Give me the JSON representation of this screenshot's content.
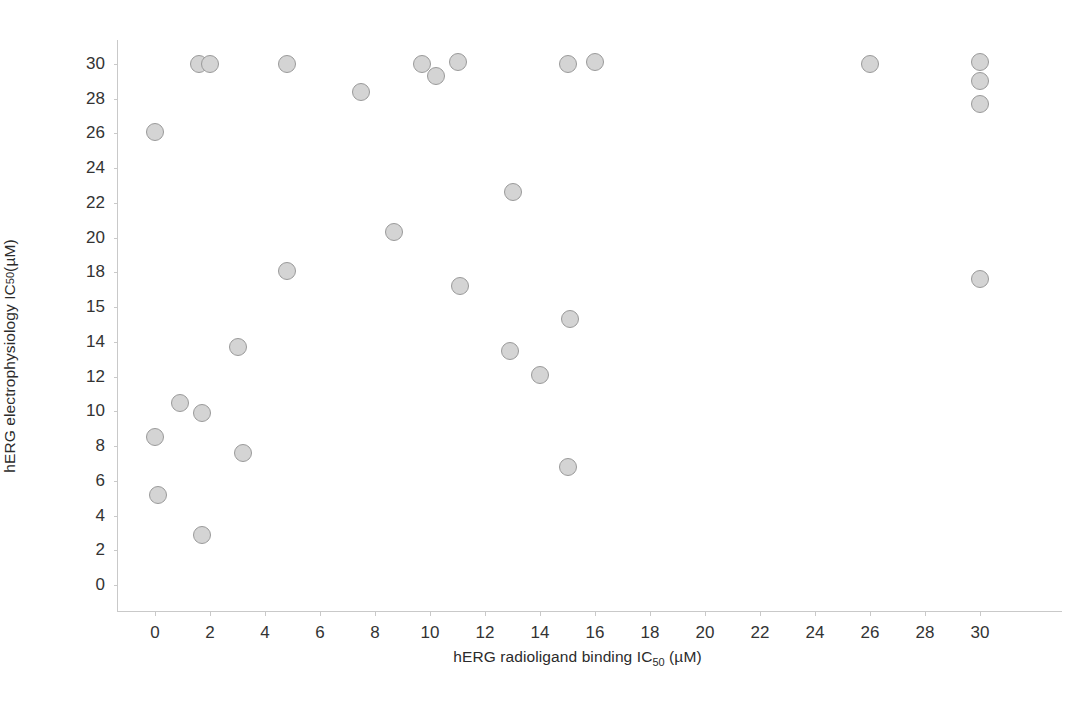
{
  "chart_data": {
    "type": "scatter",
    "title": "",
    "xlabel": "hERG radioligand binding IC50 (µM)",
    "ylabel": "hERG electrophysiology IC50 (µM)",
    "xlabel_parts": {
      "pre": "hERG radioligand binding IC",
      "sub": "50",
      "post": " (µM)"
    },
    "ylabel_parts": {
      "pre": "hERG electrophysiology IC",
      "sub": "50",
      "post": " (µM)"
    },
    "units": "µM",
    "grid": false,
    "legend": null,
    "xlim": [
      -1.2,
      31.5
    ],
    "ylim": [
      0,
      31
    ],
    "xticks": [
      0,
      2,
      4,
      6,
      8,
      10,
      12,
      14,
      16,
      18,
      20,
      22,
      24,
      26,
      28,
      30
    ],
    "xticklabels": [
      "0",
      "2",
      "4",
      "6",
      "8",
      "10",
      "12",
      "14",
      "16",
      "18",
      "20",
      "22",
      "24",
      "26",
      "28",
      "30"
    ],
    "yticks": [
      0,
      2,
      4,
      6,
      8,
      10,
      12,
      14,
      16,
      18,
      20,
      22,
      24,
      26,
      28,
      30
    ],
    "yticklabels": [
      "0",
      "2",
      "4",
      "6",
      "8",
      "10",
      "12",
      "14",
      "15",
      "18",
      "20",
      "22",
      "24",
      "26",
      "28",
      "30"
    ],
    "marker": {
      "shape": "circle",
      "fill_color": "#d4d4d4",
      "edge_color": "#9a9a9a",
      "size_px": 18
    },
    "n_points": 33,
    "points": [
      {
        "x": 0.0,
        "y": 26.1
      },
      {
        "x": 0.0,
        "y": 8.5
      },
      {
        "x": 0.1,
        "y": 5.2
      },
      {
        "x": 0.9,
        "y": 10.5
      },
      {
        "x": 1.6,
        "y": 30.0
      },
      {
        "x": 2.0,
        "y": 30.0
      },
      {
        "x": 1.7,
        "y": 9.9
      },
      {
        "x": 1.7,
        "y": 2.9
      },
      {
        "x": 3.0,
        "y": 13.7
      },
      {
        "x": 3.2,
        "y": 7.6
      },
      {
        "x": 4.8,
        "y": 30.0
      },
      {
        "x": 4.8,
        "y": 18.1
      },
      {
        "x": 7.5,
        "y": 28.4
      },
      {
        "x": 8.7,
        "y": 20.3
      },
      {
        "x": 9.7,
        "y": 30.0
      },
      {
        "x": 10.2,
        "y": 29.3
      },
      {
        "x": 11.0,
        "y": 30.1
      },
      {
        "x": 11.1,
        "y": 17.2
      },
      {
        "x": 13.0,
        "y": 22.6
      },
      {
        "x": 12.9,
        "y": 13.5
      },
      {
        "x": 14.0,
        "y": 12.1
      },
      {
        "x": 15.0,
        "y": 30.0
      },
      {
        "x": 15.1,
        "y": 15.3
      },
      {
        "x": 15.0,
        "y": 6.8
      },
      {
        "x": 16.0,
        "y": 30.1
      },
      {
        "x": 26.0,
        "y": 30.0
      },
      {
        "x": 30.0,
        "y": 30.1
      },
      {
        "x": 30.0,
        "y": 29.0
      },
      {
        "x": 30.0,
        "y": 27.7
      },
      {
        "x": 30.0,
        "y": 17.6
      }
    ]
  },
  "axes": {
    "y_axis_name": "y-axis",
    "x_axis_name": "x-axis"
  }
}
